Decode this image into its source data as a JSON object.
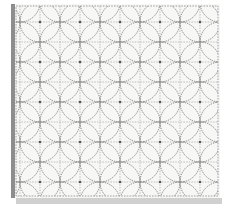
{
  "image": {
    "subject": "sashiko embroidered fabric panel",
    "pattern": "shippo (overlapping circles)",
    "colors": {
      "background": "#ffffff",
      "fabric": "#f7f7f6",
      "stitch": "#6f6f6f",
      "grid_stitch": "#9a9a9a",
      "shadow": "#b9b9b9",
      "fold": "#8d8d8d"
    },
    "fabric_bounds": {
      "x": 14,
      "y": 4,
      "w": 206,
      "h": 194
    },
    "pattern_bounds": {
      "x": 16,
      "y": 6,
      "w": 202,
      "h": 190
    },
    "circle_radius": 20,
    "lattice_pitch": 40,
    "grid_pitch": 20
  }
}
